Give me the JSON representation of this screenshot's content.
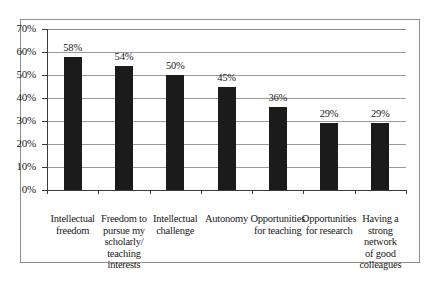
{
  "figure": {
    "frame_color": "#8c8c8c",
    "rule_color": "#2e2e2e"
  },
  "chart_data": {
    "type": "bar",
    "title": "",
    "subtitle": "",
    "xlabel": "",
    "ylabel": "",
    "ylim": [
      0,
      70
    ],
    "grid": true,
    "legend": null,
    "bar_color": "#1b1b1b",
    "orientation": "vertical",
    "y_ticks": [
      "0%",
      "10%",
      "20%",
      "30%",
      "40%",
      "50%",
      "60%",
      "70%"
    ],
    "y_tick_values": [
      0,
      10,
      20,
      30,
      40,
      50,
      60,
      70
    ],
    "categories": [
      "Intellectual freedom",
      "Freedom to pursue my scholarly/ teaching interests",
      "Intellectual challenge",
      "Autonomy",
      "Opportunities for teaching",
      "Opportunities for research",
      "Having a strong network of good colleagues"
    ],
    "category_lines": [
      [
        "Intellectual",
        "freedom"
      ],
      [
        "Freedom to",
        "pursue my",
        "scholarly/",
        "teaching",
        "interests"
      ],
      [
        "Intellectual",
        "challenge"
      ],
      [
        "Autonomy"
      ],
      [
        "Opportunities",
        "for teaching"
      ],
      [
        "Opportunities",
        "for research"
      ],
      [
        "Having a",
        "strong",
        "network",
        "of good",
        "colleagues"
      ]
    ],
    "values": [
      58,
      54,
      50,
      45,
      36,
      29,
      29
    ],
    "data_labels": [
      "58%",
      "54%",
      "50%",
      "45%",
      "36%",
      "29%",
      "29%"
    ]
  }
}
